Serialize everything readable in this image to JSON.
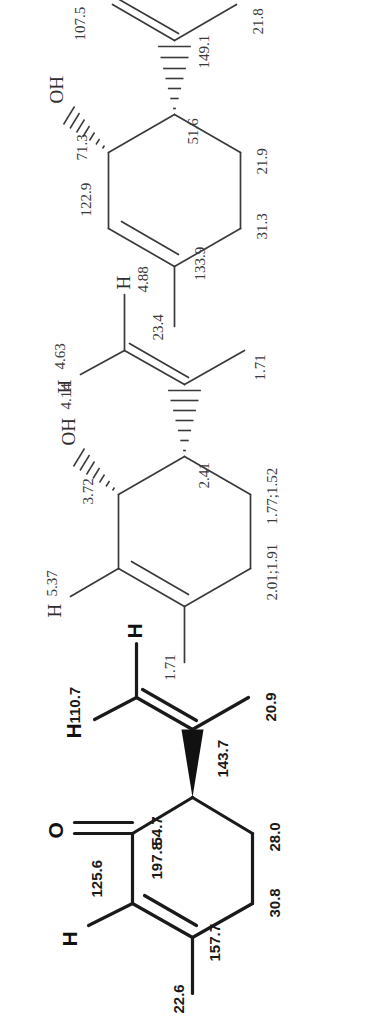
{
  "figure": {
    "kind": "chemical-structure-panel-series",
    "orientation": "rotated-90-ccw",
    "panel_count": 3,
    "background_color": "#ffffff",
    "line_color": "#3a3a3a",
    "bold_line_color": "#1a1a1a"
  },
  "structures": [
    {
      "id": "structure-1",
      "name": "trans-carveol",
      "shift_type": "13C",
      "skeleton": "cyclohexene ring, methyl, hydroxyl on hashed bond, isopropenyl on hashed bond",
      "atoms": [
        {
          "key": "oh",
          "text": "OH",
          "role": "hydroxyl-group"
        }
      ],
      "labels": [
        {
          "key": "c-methyl-ring",
          "text": "23.4",
          "assignment": "ring methyl carbon"
        },
        {
          "key": "c-alkene-ch",
          "text": "122.9",
          "assignment": "ring alkene CH"
        },
        {
          "key": "c-carbinol",
          "text": "71.3",
          "assignment": "carbinol CH-OH"
        },
        {
          "key": "c-alkene-quart",
          "text": "133.9",
          "assignment": "ring alkene quaternary C"
        },
        {
          "key": "c-allylic-ch",
          "text": "51.6",
          "assignment": "ring CH bearing isopropenyl"
        },
        {
          "key": "c-ring-ch2-a",
          "text": "31.3",
          "assignment": "ring CH2"
        },
        {
          "key": "c-ring-ch2-b",
          "text": "21.9",
          "assignment": "ring CH2"
        },
        {
          "key": "c-isopropenyl-q",
          "text": "149.1",
          "assignment": "isopropenyl quaternary C"
        },
        {
          "key": "c-vinyl-ch2",
          "text": "107.5",
          "assignment": "isopropenyl =CH2"
        },
        {
          "key": "c-isopropenyl-me",
          "text": "21.8",
          "assignment": "isopropenyl methyl"
        }
      ]
    },
    {
      "id": "structure-2",
      "name": "trans-carveol (proton shifts)",
      "shift_type": "1H",
      "skeleton": "cyclohexene ring, methyl, hydroxyl on hashed bond, isopropenyl on hashed bond, explicit H atoms",
      "atoms": [
        {
          "key": "h-alkene",
          "text": "H",
          "role": "ring-alkene-hydrogen"
        },
        {
          "key": "oh",
          "text": "OH",
          "role": "hydroxyl-group"
        },
        {
          "key": "h-vinyl-e",
          "text": "H",
          "role": "vinyl-hydrogen"
        },
        {
          "key": "h-vinyl-z",
          "text": "H",
          "role": "vinyl-hydrogen"
        }
      ],
      "labels": [
        {
          "key": "h-methyl-ring",
          "text": "1.71",
          "assignment": "ring methyl protons"
        },
        {
          "key": "h-alkene-shift",
          "text": "5.37",
          "assignment": "ring alkene H"
        },
        {
          "key": "h-carbinol",
          "text": "3.72",
          "assignment": "carbinol CH"
        },
        {
          "key": "h-hydroxyl",
          "text": "4.14",
          "assignment": "OH proton"
        },
        {
          "key": "h-allylic-ch",
          "text": "2.41",
          "assignment": "ring CH bearing isopropenyl"
        },
        {
          "key": "h-ring-ch2-a",
          "text": "2.01;1.91",
          "assignment": "ring CH2 diastereotopic protons"
        },
        {
          "key": "h-ring-ch2-b",
          "text": "1.77;1.52",
          "assignment": "ring CH2 diastereotopic protons"
        },
        {
          "key": "h-vinyl-a",
          "text": "4.63",
          "assignment": "isopropenyl =CH2 proton"
        },
        {
          "key": "h-vinyl-b",
          "text": "4.88",
          "assignment": "isopropenyl =CH2 proton"
        },
        {
          "key": "h-isopropenyl-me",
          "text": "1.71",
          "assignment": "isopropenyl methyl protons"
        }
      ]
    },
    {
      "id": "structure-3",
      "name": "carvone",
      "shift_type": "13C",
      "skeleton": "cyclohexenone ring, methyl, ketone C=O, isopropenyl on bold wedge, explicit H atoms",
      "atoms": [
        {
          "key": "h-alkene",
          "text": "H",
          "role": "ring-alkene-hydrogen"
        },
        {
          "key": "o-ketone",
          "text": "O",
          "role": "ketone-oxygen"
        },
        {
          "key": "h-vinyl-e",
          "text": "H",
          "role": "vinyl-hydrogen"
        },
        {
          "key": "h-vinyl-z",
          "text": "H",
          "role": "vinyl-hydrogen"
        }
      ],
      "labels": [
        {
          "key": "c-methyl-ring",
          "text": "22.6",
          "assignment": "ring methyl carbon"
        },
        {
          "key": "c-alkene-ch",
          "text": "125.6",
          "assignment": "ring alkene CH"
        },
        {
          "key": "c-carbonyl",
          "text": "197.8",
          "assignment": "ketone carbonyl C"
        },
        {
          "key": "c-alpha-ch",
          "text": "54.7",
          "assignment": "alpha CH bearing isopropenyl"
        },
        {
          "key": "c-alkene-quart",
          "text": "157.7",
          "assignment": "ring alkene quaternary C"
        },
        {
          "key": "c-ring-ch2-a",
          "text": "30.8",
          "assignment": "ring CH2"
        },
        {
          "key": "c-ring-ch2-b",
          "text": "28.0",
          "assignment": "ring CH2"
        },
        {
          "key": "c-isopropenyl-q",
          "text": "143.7",
          "assignment": "isopropenyl quaternary C"
        },
        {
          "key": "c-vinyl-ch2",
          "text": "110.7",
          "assignment": "isopropenyl =CH2"
        },
        {
          "key": "c-isopropenyl-me",
          "text": "20.9",
          "assignment": "isopropenyl methyl"
        }
      ]
    }
  ]
}
